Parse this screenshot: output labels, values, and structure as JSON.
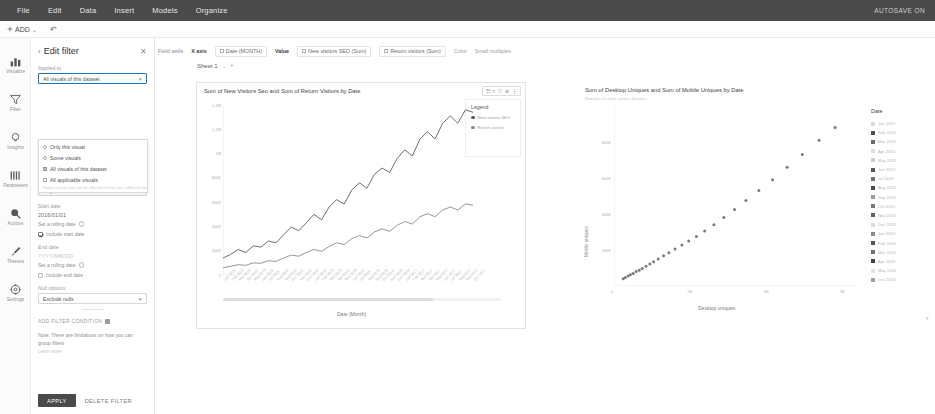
{
  "menubar": {
    "items": [
      "File",
      "Edit",
      "Data",
      "Insert",
      "Models",
      "Organize"
    ],
    "autosave": "AUTOSAVE ON"
  },
  "subbar": {
    "add_label": "ADD",
    "chevron": "⌄",
    "undo_icon": "↶"
  },
  "rail": {
    "items": [
      {
        "label": "Visualize",
        "icon": "chart-bars-icon"
      },
      {
        "label": "Filter",
        "icon": "funnel-icon"
      },
      {
        "label": "Insights",
        "icon": "lightbulb-icon"
      },
      {
        "label": "Parameters",
        "icon": "sliders-icon"
      },
      {
        "label": "Actions",
        "icon": "cursor-click-icon"
      },
      {
        "label": "Themes",
        "icon": "paintbrush-icon"
      },
      {
        "label": "Settings",
        "icon": "gear-icon"
      }
    ]
  },
  "filter_panel": {
    "title": "Edit filter",
    "back_chevron": "‹",
    "close_icon": "✕",
    "applied_to_label": "Applied to",
    "applied_to_value": "All visuals of this dataset",
    "applied_to_options": [
      {
        "label": "Only this visual",
        "type": "radio",
        "selected": false
      },
      {
        "label": "Some visuals",
        "type": "radio",
        "selected": false
      },
      {
        "label": "All visuals of this dataset",
        "type": "check",
        "selected": true
      },
      {
        "label": "All applicable visuals",
        "type": "check",
        "selected": false
      }
    ],
    "applied_to_hint": "Some visuals may not be affected if they use a different dataset",
    "condition_label": "Condition",
    "condition_value": "Between",
    "use_parameters_label": "Use parameters",
    "use_parameters_checked": false,
    "granularity_label": "Time granularity",
    "granularity_value": "Day",
    "start_date_label": "Start date",
    "start_date_value": "2016/01/01",
    "start_rolling_label": "Set a rolling date",
    "include_start_label": "Include start date",
    "include_start_checked": true,
    "end_date_label": "End date",
    "end_date_value": "YYYY/MM/DD",
    "end_rolling_label": "Set a rolling date",
    "include_end_label": "Include end date",
    "include_end_checked": false,
    "null_label": "Null options",
    "null_value": "Exclude nulls",
    "add_condition_label": "ADD FILTER CONDITION",
    "note": "Note: There are limitations on how you can group filters",
    "note_link": "Learn more",
    "apply_label": "APPLY",
    "delete_label": "DELETE FILTER"
  },
  "field_wells": {
    "label": "Field wells",
    "x_axis_label": "X axis",
    "x_axis_field": "Date (MONTH)",
    "value_label": "Value",
    "value_fields": [
      "New visitors SEO (Sum)",
      "Return visitors (Sum)"
    ],
    "color_label": "Color",
    "small_multiples_label": "Small multiples"
  },
  "sheet": {
    "name": "Sheet 1",
    "chevron": "⌄",
    "add": "+"
  },
  "chart_data": [
    {
      "type": "line",
      "title": "Sum of New Visitors Seo and Sum of Return Visitors by Date",
      "xlabel": "Date (Month)",
      "ylabel": "",
      "ylim": [
        0,
        1400000
      ],
      "ytick_labels": [
        "1.4M",
        "1.2M",
        "1M",
        "800K",
        "600K",
        "400K",
        "200K",
        "0"
      ],
      "ytick_values": [
        1400000,
        1200000,
        1000000,
        800000,
        600000,
        400000,
        200000,
        0
      ],
      "grid": false,
      "legend_title": "Legend",
      "legend_position": "right",
      "categories": [
        "Jan 2015",
        "Feb 2015",
        "Mar 2015",
        "Apr 2015",
        "May 2015",
        "Jun 2015",
        "Jul 2015",
        "Aug 2015",
        "Sep 2015",
        "Oct 2015",
        "Nov 2015",
        "Dec 2015",
        "Jan 2016",
        "Feb 2016",
        "Mar 2016",
        "Apr 2016",
        "May 2016",
        "Jun 2016",
        "Jul 2016",
        "Aug 2016",
        "Sep 2016",
        "Oct 2016",
        "Nov 2016",
        "Dec 2016",
        "Jan 2017",
        "Feb 2017",
        "Mar 2017",
        "Apr 2017",
        "May 2017",
        "Jun 2017",
        "Jul 2017",
        "Aug 2017",
        "Sep 2017",
        "Oct 2017"
      ],
      "series": [
        {
          "name": "New visitors SEO",
          "color": "#5c5c5c",
          "values": [
            140000,
            170000,
            210000,
            185000,
            240000,
            230000,
            280000,
            265000,
            330000,
            395000,
            365000,
            430000,
            500000,
            455000,
            560000,
            620000,
            585000,
            700000,
            760000,
            715000,
            830000,
            880000,
            845000,
            960000,
            1030000,
            980000,
            1120000,
            1180000,
            1120000,
            1250000,
            1310000,
            1250000,
            1360000,
            1340000
          ]
        },
        {
          "name": "Return visitors",
          "color": "#8a8a8a",
          "values": [
            60000,
            72000,
            85000,
            80000,
            100000,
            96000,
            118000,
            112000,
            140000,
            165000,
            155000,
            185000,
            210000,
            195000,
            235000,
            265000,
            250000,
            300000,
            325000,
            305000,
            355000,
            380000,
            360000,
            410000,
            440000,
            420000,
            480000,
            505000,
            480000,
            535000,
            560000,
            535000,
            585000,
            575000
          ]
        }
      ]
    },
    {
      "type": "scatter",
      "title": "Sum of Desktop Uniques and Sum of Mobile Uniques by Date",
      "subtitle": "Number of visits across devices",
      "xlabel": "Desktop uniques",
      "ylabel": "Mobile uniques",
      "xlim": [
        0,
        3200000
      ],
      "ylim": [
        0,
        1000000
      ],
      "xtick_labels": [
        "0",
        "1M",
        "2M",
        "3M"
      ],
      "xtick_values": [
        0,
        1000000,
        2000000,
        3000000
      ],
      "ytick_labels": [
        "800K",
        "600K",
        "400K",
        "200K"
      ],
      "ytick_values": [
        800000,
        600000,
        400000,
        200000
      ],
      "grid": false,
      "legend_title": "Date",
      "legend_position": "right",
      "legend_entries": [
        {
          "label": "Jan 2015",
          "color": "#d9d9d9"
        },
        {
          "label": "Feb 2015",
          "color": "#4d4d4d"
        },
        {
          "label": "Mar 2015",
          "color": "#6b6b6b"
        },
        {
          "label": "Apr 2015",
          "color": "#e0e0e0"
        },
        {
          "label": "May 2015",
          "color": "#cfcfcf"
        },
        {
          "label": "Jun 2015",
          "color": "#585858"
        },
        {
          "label": "Jul 2015",
          "color": "#707070"
        },
        {
          "label": "Aug 2015",
          "color": "#4a4a4a"
        },
        {
          "label": "Sep 2015",
          "color": "#9a9a9a"
        },
        {
          "label": "Oct 2015",
          "color": "#777777"
        },
        {
          "label": "Nov 2015",
          "color": "#636363"
        },
        {
          "label": "Dec 2015",
          "color": "#dddddd"
        },
        {
          "label": "Jan 2016",
          "color": "#8c8c8c"
        },
        {
          "label": "Feb 2016",
          "color": "#555555"
        },
        {
          "label": "Mar 2016",
          "color": "#6e6e6e"
        },
        {
          "label": "Apr 2016",
          "color": "#404040"
        },
        {
          "label": "May 2016",
          "color": "#e3e3e3"
        },
        {
          "label": "Jun 2016",
          "color": "#a0a0a0"
        }
      ],
      "points": [
        {
          "x": 120000,
          "y": 40000
        },
        {
          "x": 150000,
          "y": 48000
        },
        {
          "x": 185000,
          "y": 55000
        },
        {
          "x": 215000,
          "y": 62000
        },
        {
          "x": 250000,
          "y": 70000
        },
        {
          "x": 290000,
          "y": 80000
        },
        {
          "x": 330000,
          "y": 88000
        },
        {
          "x": 370000,
          "y": 98000
        },
        {
          "x": 420000,
          "y": 110000
        },
        {
          "x": 470000,
          "y": 122000
        },
        {
          "x": 520000,
          "y": 135000
        },
        {
          "x": 580000,
          "y": 150000
        },
        {
          "x": 650000,
          "y": 168000
        },
        {
          "x": 720000,
          "y": 185000
        },
        {
          "x": 800000,
          "y": 205000
        },
        {
          "x": 890000,
          "y": 228000
        },
        {
          "x": 980000,
          "y": 250000
        },
        {
          "x": 1080000,
          "y": 275000
        },
        {
          "x": 1190000,
          "y": 305000
        },
        {
          "x": 1310000,
          "y": 340000
        },
        {
          "x": 1440000,
          "y": 380000
        },
        {
          "x": 1580000,
          "y": 425000
        },
        {
          "x": 1730000,
          "y": 475000
        },
        {
          "x": 1900000,
          "y": 530000
        },
        {
          "x": 2080000,
          "y": 590000
        },
        {
          "x": 2270000,
          "y": 660000
        },
        {
          "x": 2470000,
          "y": 730000
        },
        {
          "x": 2690000,
          "y": 810000
        },
        {
          "x": 2900000,
          "y": 880000
        }
      ]
    }
  ],
  "visual_toolbar": {
    "icons": [
      "filter-apply-icon",
      "sort-icon",
      "funnel-icon",
      "pin-icon",
      "menu-dots-icon"
    ],
    "glyphs": [
      "☷",
      "↕",
      "▽",
      "⊘",
      "⋮"
    ]
  }
}
